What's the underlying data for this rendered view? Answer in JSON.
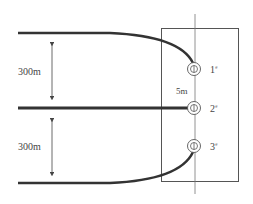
{
  "diagram": {
    "distance_labels": {
      "upper": "300m",
      "lower": "300m",
      "spacing": "5m"
    },
    "wells": [
      {
        "id": "1",
        "label": "1",
        "marker": "#"
      },
      {
        "id": "2",
        "label": "2",
        "marker": "#"
      },
      {
        "id": "3",
        "label": "3",
        "marker": "#"
      }
    ],
    "colors": {
      "line": "#333333",
      "thin_line": "#555555",
      "text": "#444444"
    }
  }
}
